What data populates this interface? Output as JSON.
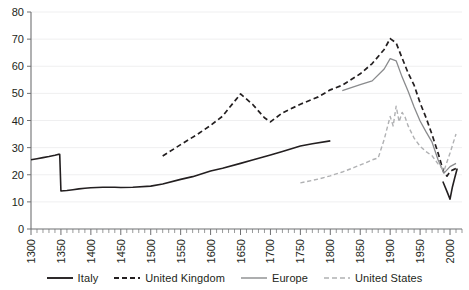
{
  "chart_data": {
    "type": "line",
    "title": "",
    "xlabel": "",
    "ylabel": "",
    "xlim": [
      1300,
      2020
    ],
    "ylim": [
      0,
      80
    ],
    "grid": true,
    "grid_axis": "y",
    "legend_position": "bottom",
    "y_ticks": [
      0,
      10,
      20,
      30,
      40,
      50,
      60,
      70,
      80
    ],
    "x_ticks": [
      1300,
      1350,
      1400,
      1450,
      1500,
      1550,
      1600,
      1650,
      1700,
      1750,
      1800,
      1850,
      1900,
      1950,
      2000
    ],
    "x_minor_tick_step": 10,
    "series": [
      {
        "name": "Italy",
        "color": "#231f20",
        "style": "solid",
        "width": 1.6,
        "segments": [
          {
            "x": [
              1300,
              1310,
              1320,
              1330,
              1340,
              1345,
              1348,
              1350,
              1360,
              1370,
              1380,
              1390,
              1400,
              1420,
              1440,
              1450,
              1470,
              1500,
              1520,
              1550,
              1570,
              1600,
              1620,
              1650,
              1670,
              1700,
              1720,
              1750,
              1770,
              1800
            ],
            "y": [
              25.5,
              25.9,
              26.3,
              26.7,
              27.2,
              27.5,
              27.5,
              14.0,
              14.2,
              14.5,
              14.8,
              15.0,
              15.2,
              15.4,
              15.4,
              15.3,
              15.4,
              15.8,
              16.6,
              18.3,
              19.3,
              21.4,
              22.4,
              24.2,
              25.4,
              27.3,
              28.6,
              30.6,
              31.4,
              32.5
            ]
          },
          {
            "x": [
              1988,
              1995,
              2000,
              2004,
              2008,
              2012
            ],
            "y": [
              17.5,
              13.8,
              11.0,
              15.5,
              19.0,
              22.3
            ]
          }
        ]
      },
      {
        "name": "United Kingdom",
        "color": "#231f20",
        "style": "dashed",
        "width": 1.7,
        "segments": [
          {
            "x": [
              1520,
              1550,
              1580,
              1600,
              1620,
              1650,
              1670,
              1690,
              1700,
              1720,
              1750,
              1780,
              1800,
              1820,
              1850,
              1870,
              1890,
              1900,
              1910,
              1920,
              1930,
              1940,
              1950,
              1960,
              1970,
              1980,
              1990,
              1995,
              2000,
              2005,
              2010
            ],
            "y": [
              26.9,
              31.1,
              35.2,
              38.2,
              41.6,
              49.8,
              46.0,
              41.0,
              39.5,
              42.8,
              46.0,
              48.7,
              51.3,
              53.0,
              57.2,
              61.0,
              66.2,
              70.2,
              68.6,
              63.0,
              57.5,
              53.0,
              46.5,
              41.0,
              34.8,
              28.0,
              20.5,
              19.5,
              21.2,
              21.8,
              22.3
            ]
          }
        ]
      },
      {
        "name": "Europe",
        "color": "#8a8b8d",
        "style": "solid",
        "width": 1.3,
        "segments": [
          {
            "x": [
              1820,
              1850,
              1870,
              1890,
              1900,
              1910,
              1920,
              1930,
              1940,
              1950,
              1960,
              1970,
              1980,
              1990,
              2000,
              2010
            ],
            "y": [
              51.0,
              53.2,
              54.6,
              59.0,
              62.8,
              62.0,
              56.0,
              50.8,
              45.0,
              39.8,
              35.8,
              32.0,
              25.5,
              20.6,
              23.0,
              24.2
            ]
          }
        ]
      },
      {
        "name": "United States",
        "color": "#b0b1b3",
        "style": "dashed",
        "width": 1.4,
        "segments": [
          {
            "x": [
              1750,
              1780,
              1800,
              1820,
              1840,
              1860,
              1870,
              1880,
              1890,
              1900,
              1905,
              1910,
              1915,
              1920,
              1925,
              1930,
              1940,
              1950,
              1960,
              1970,
              1980,
              1990,
              2000,
              2005,
              2010
            ],
            "y": [
              17.0,
              18.4,
              19.6,
              21.0,
              22.7,
              24.5,
              25.5,
              26.2,
              33.0,
              41.5,
              38.0,
              45.3,
              39.5,
              43.0,
              41.2,
              38.0,
              33.5,
              30.5,
              28.5,
              27.0,
              24.0,
              21.5,
              28.0,
              31.5,
              35.0
            ]
          }
        ]
      }
    ]
  },
  "legend": {
    "items": [
      {
        "label": "Italy"
      },
      {
        "label": "United Kingdom"
      },
      {
        "label": "Europe"
      },
      {
        "label": "United States"
      }
    ]
  }
}
